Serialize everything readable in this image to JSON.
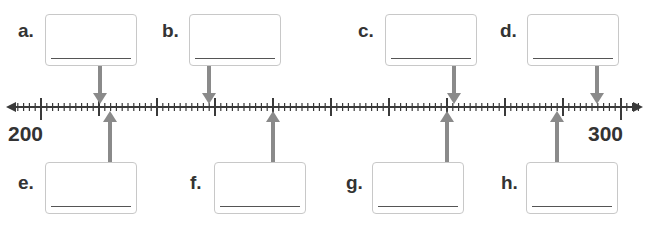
{
  "number_line": {
    "start_label": "200",
    "end_label": "300",
    "start_value": 200,
    "end_value": 300,
    "minor_step": 1,
    "major_step": 10
  },
  "items": [
    {
      "letter": "a.",
      "answer": "",
      "position": "above"
    },
    {
      "letter": "b.",
      "answer": "",
      "position": "above"
    },
    {
      "letter": "c.",
      "answer": "",
      "position": "above"
    },
    {
      "letter": "d.",
      "answer": "",
      "position": "above"
    },
    {
      "letter": "e.",
      "answer": "",
      "position": "below"
    },
    {
      "letter": "f.",
      "answer": "",
      "position": "below"
    },
    {
      "letter": "g.",
      "answer": "",
      "position": "below"
    },
    {
      "letter": "h.",
      "answer": "",
      "position": "below"
    }
  ],
  "colors": {
    "arrow": "#8a8a8a",
    "line": "#3a3a3a",
    "box_border": "#c8c8c8"
  }
}
